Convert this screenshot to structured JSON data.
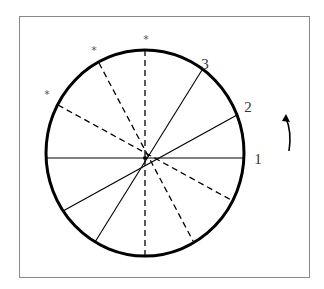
{
  "diagram": {
    "type": "rotating-disc-diagram",
    "frame": {
      "x": 19,
      "y": 16,
      "width": 290,
      "height": 261,
      "stroke": "#888888"
    },
    "circle": {
      "cx": 145,
      "cy": 153,
      "rx": 99,
      "ry": 103,
      "stroke": "#000000",
      "stroke_width": 3
    },
    "center": {
      "x": 145,
      "y": 158
    },
    "solid_spokes": [
      {
        "id": "1",
        "x1": 46,
        "y1": 158,
        "x2": 244,
        "y2": 158
      },
      {
        "id": "2",
        "x1": 63,
        "y1": 211,
        "x2": 237,
        "y2": 115
      },
      {
        "id": "3",
        "x1": 95,
        "y1": 242,
        "x2": 202,
        "y2": 70
      }
    ],
    "dashed_spokes": [
      {
        "id": "d1",
        "x1": 145,
        "y1": 50,
        "x2": 145,
        "y2": 256
      },
      {
        "id": "d2",
        "x1": 99,
        "y1": 63,
        "x2": 193,
        "y2": 241
      },
      {
        "id": "d3",
        "x1": 58,
        "y1": 105,
        "x2": 233,
        "y2": 201
      }
    ],
    "labels": [
      {
        "text": "1",
        "x": 258,
        "y": 164
      },
      {
        "text": "2",
        "x": 248,
        "y": 112
      },
      {
        "text": "3",
        "x": 205,
        "y": 69
      }
    ],
    "stars": [
      {
        "text": "*",
        "x": 146,
        "y": 43
      },
      {
        "text": "*",
        "x": 94,
        "y": 54
      },
      {
        "text": "*",
        "x": 47,
        "y": 98
      }
    ],
    "rotation_arrow": {
      "direction": "counterclockwise",
      "path": "M 289 151 Q 292 132 286 118",
      "head": "282,121 286,114 290,122"
    }
  }
}
